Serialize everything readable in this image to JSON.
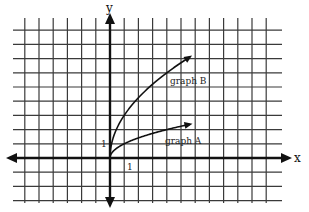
{
  "chart_data": {
    "type": "line",
    "title": "",
    "xlabel": "x",
    "ylabel": "y",
    "grid": true,
    "xlim": [
      -6.8,
      12.2
    ],
    "ylim": [
      -3.1,
      9.1
    ],
    "unit_labels": {
      "x": "1",
      "y": "1"
    },
    "series": [
      {
        "name": "graph A",
        "function": "y = sqrt(x)",
        "x": [
          0,
          0.5,
          1,
          2,
          3,
          4,
          5,
          5.6
        ],
        "values": [
          0,
          0.71,
          1,
          1.41,
          1.73,
          2,
          2.24,
          2.37
        ]
      },
      {
        "name": "graph B",
        "function": "y = 3*sqrt(x)",
        "x": [
          0,
          0.5,
          1,
          2,
          3,
          4,
          5,
          5.6
        ],
        "values": [
          0,
          2.12,
          3,
          4.24,
          5.2,
          6,
          6.71,
          7.1
        ]
      }
    ]
  },
  "labels": {
    "x_axis": "x",
    "y_axis": "y",
    "x_unit": "1",
    "y_unit": "1",
    "graph_a": "graph A",
    "graph_b": "graph B"
  },
  "colors": {
    "grid": "#3a3a3a",
    "axis": "#111111",
    "curve": "#111111"
  }
}
